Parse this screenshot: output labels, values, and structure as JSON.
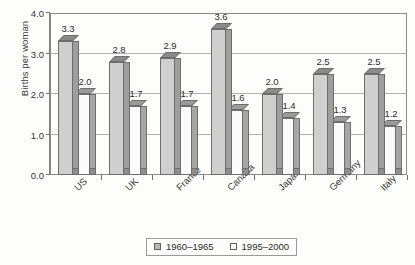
{
  "chart_data": {
    "type": "bar",
    "title": "",
    "subtitle": "",
    "xlabel": "",
    "ylabel": "Births per woman",
    "categories": [
      "US",
      "UK",
      "France",
      "Canada",
      "Japan",
      "Germany",
      "Italy"
    ],
    "series": [
      {
        "name": "1960–1965",
        "values": [
          3.3,
          2.8,
          2.9,
          3.6,
          2.0,
          2.5,
          2.5
        ],
        "color": "#cfcfcf"
      },
      {
        "name": "1995–2000",
        "values": [
          2.0,
          1.7,
          1.7,
          1.6,
          1.4,
          1.3,
          1.2
        ],
        "color": "#fbfbfb"
      }
    ],
    "data_labels": [
      [
        "3.3",
        "2.8",
        "2.9",
        "3.6",
        "2.0",
        "2.5",
        "2.5"
      ],
      [
        "2.0",
        "1.7",
        "1.7",
        "1.6",
        "1.4",
        "1.3",
        "1.2"
      ]
    ],
    "ylim": [
      0.0,
      4.0
    ],
    "yticks": [
      0.0,
      1.0,
      2.0,
      3.0,
      4.0
    ],
    "ytick_labels": [
      "0.0",
      "1.0",
      "2.0",
      "3.0",
      "4.0"
    ],
    "gridlines": [
      1.0,
      2.0,
      3.0
    ],
    "grid": true,
    "legend_position": "bottom-center",
    "style": "3d-column",
    "xtick_label_rotation": -45
  },
  "axis": {
    "y_title": "Births per woman"
  },
  "legend": {
    "entries": [
      {
        "label": "1960–1965",
        "swatch": "filled-gray-swatch"
      },
      {
        "label": "1995–2000",
        "swatch": "empty-white-swatch"
      }
    ]
  }
}
